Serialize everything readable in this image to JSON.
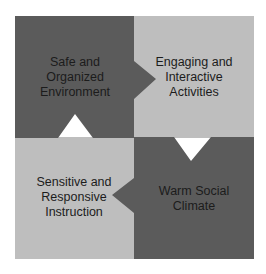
{
  "diagram": {
    "colors": {
      "dark": "#5b5b5b",
      "light": "#bebebe",
      "text": "#1c1c1c",
      "background": "#ffffff"
    },
    "quadrants": [
      {
        "position": "top-left",
        "shade": "dark",
        "lines": [
          "Safe and",
          "Organized",
          "Environment"
        ],
        "arrow_direction": "right"
      },
      {
        "position": "top-right",
        "shade": "light",
        "lines": [
          "Engaging and",
          "Interactive",
          "Activities"
        ],
        "arrow_direction": "down"
      },
      {
        "position": "bottom-right",
        "shade": "dark",
        "lines": [
          "Warm Social",
          "Climate"
        ],
        "arrow_direction": "left"
      },
      {
        "position": "bottom-left",
        "shade": "light",
        "lines": [
          "Sensitive and",
          "Responsive",
          "Instruction"
        ],
        "arrow_direction": "up"
      }
    ]
  }
}
